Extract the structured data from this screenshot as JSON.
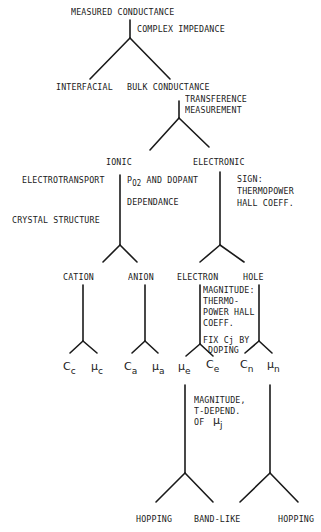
{
  "diagram": {
    "root": "MEASURED CONDUCTANCE",
    "edges": {
      "root_split": "COMPLEX IMPEDANCE",
      "bulk_split": [
        "TRANSFERENCE",
        "MEASUREMENT"
      ],
      "ionic_split_left": [
        "ELECTROTRANSPORT",
        "CRYSTAL STRUCTURE"
      ],
      "ionic_split_right": {
        "prefix": "P",
        "sub": "O2",
        "suffix": " AND DOPANT",
        "line2": "DEPENDANCE"
      },
      "electronic_split": [
        "SIGN:",
        "THERMOPOWER",
        "HALL COEFF."
      ],
      "magnitude_note": [
        "MAGNITUDE:",
        "THERMO-",
        "POWER HALL",
        "COEFF."
      ],
      "fix_note": [
        "FIX Cj BY",
        "DOPING"
      ],
      "mobility_note": [
        "MAGNITUDE,",
        "T-DEPEND.",
        "OF"
      ],
      "mobility_symbol": {
        "base": "μ",
        "sub": "j"
      }
    },
    "level1": {
      "left": "INTERFACIAL",
      "right": "BULK CONDUCTANCE"
    },
    "level2": {
      "left": "IONIC",
      "right": "ELECTRONIC"
    },
    "level3": [
      "CATION",
      "ANION",
      "ELECTRON",
      "HOLE"
    ],
    "level4": [
      {
        "base": "C",
        "sub": "c"
      },
      {
        "base": "μ",
        "sub": "c"
      },
      {
        "base": "C",
        "sub": "a"
      },
      {
        "base": "μ",
        "sub": "a"
      },
      {
        "base": "μ",
        "sub": "e"
      },
      {
        "base": "C",
        "sub": "e"
      },
      {
        "base": "C",
        "sub": "n"
      },
      {
        "base": "μ",
        "sub": "n"
      }
    ],
    "level5": [
      "HOPPING",
      "BAND-LIKE",
      "HOPPING"
    ]
  }
}
